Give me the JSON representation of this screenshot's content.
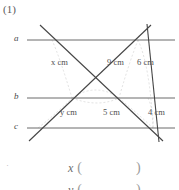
{
  "problem": {
    "number": "(1)"
  },
  "figure": {
    "type": "geometry-parallel-lines-transversals",
    "parallel_line_labels": [
      {
        "name": "line-a",
        "label": "a",
        "y": 40
      },
      {
        "name": "line-b",
        "label": "b",
        "y": 98
      },
      {
        "name": "line-c",
        "label": "c",
        "y": 128
      }
    ],
    "measurements": [
      {
        "name": "segment-x",
        "text": "x cm",
        "variable": "x",
        "unit": "cm",
        "value": null
      },
      {
        "name": "segment-9",
        "text": "9 cm",
        "variable": null,
        "unit": "cm",
        "value": 9
      },
      {
        "name": "segment-6",
        "text": "6 cm",
        "variable": null,
        "unit": "cm",
        "value": 6
      },
      {
        "name": "segment-y",
        "text": "y cm",
        "variable": "y",
        "unit": "cm",
        "value": null
      },
      {
        "name": "segment-5",
        "text": "5 cm",
        "variable": null,
        "unit": "cm",
        "value": 5
      },
      {
        "name": "segment-4",
        "text": "4 cm",
        "variable": null,
        "unit": "cm",
        "value": 4
      }
    ],
    "colors": {
      "solid_stroke": "#4a4a4a",
      "parallel_stroke": "#6b6b6b",
      "dashed_stroke": "#c8c8c8",
      "background": "#ffffff",
      "text": "#4f4f4f"
    }
  },
  "answers": {
    "x_label": "x",
    "y_label": "y",
    "open_paren": "(",
    "close_paren": ")",
    "x_value": "",
    "y_value": "",
    "bullet": "·"
  }
}
